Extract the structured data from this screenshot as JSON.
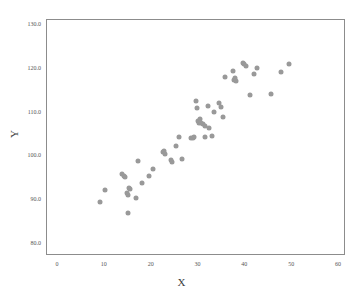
{
  "chart_data": {
    "type": "scatter",
    "title": "",
    "xlabel": "X",
    "ylabel": "Y",
    "xlim": [
      0,
      60
    ],
    "ylim": [
      78,
      132
    ],
    "grid": false,
    "legend": null,
    "marker_color": "#999999",
    "marker_size": 5,
    "xticks": [
      "0",
      "10",
      "20",
      "30",
      "40",
      "50",
      "60"
    ],
    "xtick_values": [
      0,
      10,
      20,
      30,
      40,
      50,
      60
    ],
    "yticks": [
      "80.0",
      "90.0",
      "100.0",
      "110.0",
      "120.0",
      "130.0"
    ],
    "ytick_values": [
      80,
      90,
      100,
      110,
      120,
      130
    ],
    "series": [
      {
        "name": "data",
        "points": [
          [
            9.1,
            89.3
          ],
          [
            10.3,
            92.1
          ],
          [
            13.9,
            95.8
          ],
          [
            14.3,
            95.4
          ],
          [
            14.6,
            95.1
          ],
          [
            15.0,
            91.4
          ],
          [
            15.2,
            91.0
          ],
          [
            15.3,
            92.5
          ],
          [
            15.6,
            92.3
          ],
          [
            15.1,
            86.8
          ],
          [
            16.8,
            90.2
          ],
          [
            17.4,
            98.7
          ],
          [
            18.2,
            93.8
          ],
          [
            19.6,
            95.3
          ],
          [
            20.5,
            96.8
          ],
          [
            22.6,
            100.8
          ],
          [
            22.8,
            101.1
          ],
          [
            23.1,
            100.4
          ],
          [
            24.3,
            99.0
          ],
          [
            24.6,
            98.6
          ],
          [
            25.4,
            102.1
          ],
          [
            26.1,
            104.3
          ],
          [
            26.6,
            99.1
          ],
          [
            28.6,
            103.9
          ],
          [
            29.1,
            104.0
          ],
          [
            29.3,
            104.3
          ],
          [
            29.6,
            112.4
          ],
          [
            29.8,
            110.8
          ],
          [
            30.2,
            107.9
          ],
          [
            30.3,
            107.3
          ],
          [
            30.6,
            108.4
          ],
          [
            30.7,
            107.5
          ],
          [
            31.2,
            107.1
          ],
          [
            31.5,
            106.7
          ],
          [
            31.7,
            104.3
          ],
          [
            32.2,
            111.3
          ],
          [
            32.5,
            106.2
          ],
          [
            33.0,
            104.4
          ],
          [
            33.6,
            109.9
          ],
          [
            34.6,
            112.0
          ],
          [
            35.1,
            111.0
          ],
          [
            35.4,
            108.7
          ],
          [
            35.9,
            118.0
          ],
          [
            37.6,
            119.3
          ],
          [
            37.9,
            117.3
          ],
          [
            38.0,
            117.7
          ],
          [
            38.2,
            116.9
          ],
          [
            39.7,
            121.2
          ],
          [
            39.9,
            120.9
          ],
          [
            40.4,
            120.3
          ],
          [
            41.3,
            113.8
          ],
          [
            42.0,
            118.5
          ],
          [
            42.6,
            120.0
          ],
          [
            45.8,
            114.1
          ],
          [
            47.8,
            119.1
          ],
          [
            49.5,
            120.9
          ]
        ]
      }
    ]
  },
  "axes": {
    "x_label": "X",
    "y_label": "Y"
  }
}
